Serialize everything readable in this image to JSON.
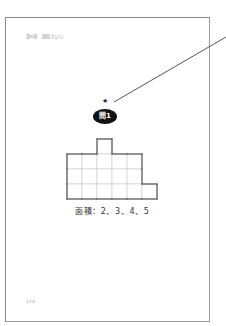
{
  "page": {
    "header": "第6章　図形たいっ",
    "page_number": "173"
  },
  "problem": {
    "star": "★",
    "badge_label": "問1",
    "area_label": "面積：2、3、4、5"
  },
  "figure": {
    "cell_size": 15,
    "origin_x": 67,
    "origin_y": 154,
    "rows": [
      {
        "row": -1,
        "cols": [
          2
        ]
      },
      {
        "row": 0,
        "cols": [
          0,
          1,
          2,
          3,
          4
        ]
      },
      {
        "row": 1,
        "cols": [
          0,
          1,
          2,
          3,
          4
        ]
      },
      {
        "row": 2,
        "cols": [
          0,
          1,
          2,
          3,
          4,
          5
        ]
      }
    ],
    "outline_color": "#555555",
    "grid_color": "#c8c8c8"
  },
  "leader": {
    "x1": 226,
    "y1": 37,
    "x2": 114,
    "y2": 102,
    "color": "#555555"
  }
}
